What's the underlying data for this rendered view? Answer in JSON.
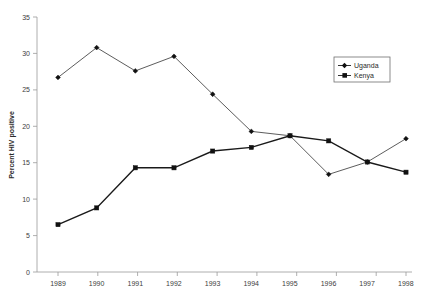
{
  "chart_data": {
    "type": "line",
    "title": "",
    "xlabel": "",
    "ylabel": "Percent HIV positive",
    "categories": [
      "1989",
      "1990",
      "1991",
      "1992",
      "1993",
      "1994",
      "1995",
      "1996",
      "1997",
      "1998"
    ],
    "x": [
      1989,
      1990,
      1991,
      1992,
      1993,
      1994,
      1995,
      1996,
      1997,
      1998
    ],
    "ylim": [
      0,
      35
    ],
    "yticks": [
      0,
      5,
      10,
      15,
      20,
      25,
      30,
      35
    ],
    "grid": false,
    "legend_position": "top-right",
    "series": [
      {
        "name": "Uganda",
        "marker": "diamond",
        "values": [
          26.7,
          30.8,
          27.6,
          29.6,
          24.4,
          19.3,
          18.7,
          13.4,
          15.1,
          18.3
        ]
      },
      {
        "name": "Kenya",
        "marker": "square",
        "values": [
          6.5,
          8.8,
          14.3,
          14.3,
          16.6,
          17.1,
          18.7,
          18.0,
          15.1,
          13.7
        ]
      }
    ]
  },
  "axes": {
    "y_tick_labels": [
      "35",
      "30",
      "25",
      "20",
      "15",
      "10",
      "5",
      "0"
    ],
    "y_axis_title": "Percent HIV positive",
    "x_tick_labels": [
      "1989",
      "1990",
      "1991",
      "1992",
      "1993",
      "1994",
      "1995",
      "1996",
      "1997",
      "1998"
    ]
  },
  "legend": {
    "items": [
      {
        "label": "Uganda"
      },
      {
        "label": "Kenya"
      }
    ]
  }
}
